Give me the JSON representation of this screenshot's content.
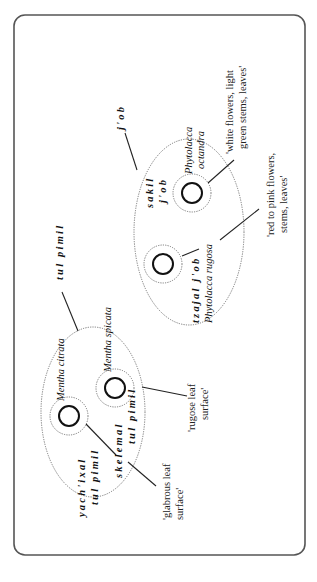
{
  "diagram": {
    "orientation": "rotated-90-ccw",
    "colors": {
      "frame": "#555555",
      "ellipse": "#777777",
      "core": "#111111",
      "text": "#111111"
    },
    "groups": {
      "job": {
        "label": "j'ob",
        "members": {
          "octandra": {
            "folk_line1": "sakil",
            "folk_line2": "j'ob",
            "sci_line1": "Phytolacca",
            "sci_line2": "octandra",
            "gloss_line1": "'white flowers, light",
            "gloss_line2": "green stems, leaves'"
          },
          "rugosa": {
            "folk": "tzajal j'ob",
            "sci": "Phytolacca rugosa",
            "gloss_line1": "'red to pink flowers,",
            "gloss_line2": "stems, leaves'"
          }
        }
      },
      "tulpimil": {
        "label": "tul pimil",
        "members": {
          "citrata": {
            "folk_line1": "yach'ixal",
            "folk_line2": "tul pimil",
            "sci": "Mentha citrata",
            "gloss_line1": "'glabrous leaf",
            "gloss_line2": "surface'"
          },
          "spicata": {
            "folk_line1": "skelemal",
            "folk_line2": "tul pimil",
            "sci": "Mentha spicata",
            "gloss_line1": "'rugose leaf",
            "gloss_line2": "surface'"
          }
        }
      }
    }
  }
}
